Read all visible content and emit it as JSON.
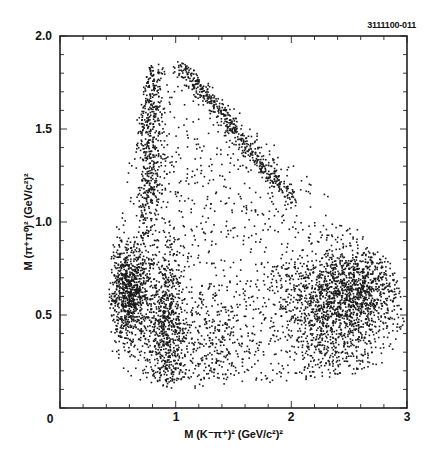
{
  "figure_id": "3111100-011",
  "chart_data": {
    "type": "scatter",
    "title": "",
    "subtitle": "Dalitz plot (dense event scatter)",
    "xlabel": "M (K⁻π⁺)² (GeV/c²)²",
    "ylabel": "M (π⁺π⁰)² (GeV/c²)²",
    "xlim": [
      0,
      3
    ],
    "ylim": [
      0,
      2.0
    ],
    "x_ticks": [
      0,
      1,
      2,
      3
    ],
    "x_tick_labels": [
      "0",
      "1",
      "2",
      "3"
    ],
    "x_minor_step": 0.2,
    "y_ticks": [
      0,
      0.5,
      1.0,
      1.5,
      2.0
    ],
    "y_tick_labels": [
      "0",
      "0.5",
      "1.0",
      "1.5",
      "2.0"
    ],
    "y_minor_step": 0.1,
    "grid": false,
    "legend": null,
    "marker_color": "#1a1a1a",
    "boundary": {
      "description": "Kinematic (Dalitz) boundary enclosing all points",
      "vertices": [
        [
          0.45,
          0.3
        ],
        [
          0.55,
          0.2
        ],
        [
          0.75,
          0.12
        ],
        [
          1.0,
          0.1
        ],
        [
          1.5,
          0.12
        ],
        [
          2.0,
          0.14
        ],
        [
          2.4,
          0.16
        ],
        [
          2.8,
          0.22
        ],
        [
          2.95,
          0.35
        ],
        [
          2.98,
          0.5
        ],
        [
          2.9,
          0.75
        ],
        [
          2.6,
          0.95
        ],
        [
          2.3,
          1.15
        ],
        [
          2.0,
          1.33
        ],
        [
          1.7,
          1.5
        ],
        [
          1.4,
          1.68
        ],
        [
          1.2,
          1.8
        ],
        [
          1.05,
          1.86
        ],
        [
          0.85,
          1.87
        ],
        [
          0.75,
          1.82
        ],
        [
          0.68,
          1.6
        ],
        [
          0.6,
          1.4
        ],
        [
          0.52,
          1.1
        ],
        [
          0.45,
          0.85
        ],
        [
          0.42,
          0.6
        ]
      ]
    },
    "density_regions": [
      {
        "name": "rho-band-left",
        "cx": 0.6,
        "cy": 0.62,
        "sx": 0.09,
        "sy": 0.13,
        "n": 900
      },
      {
        "name": "rho-band-right",
        "cx": 2.55,
        "cy": 0.62,
        "sx": 0.22,
        "sy": 0.12,
        "n": 1100
      },
      {
        "name": "rho-band-mid",
        "cx": 2.2,
        "cy": 0.6,
        "sx": 0.25,
        "sy": 0.14,
        "n": 450
      },
      {
        "name": "kstar-minus-vertical-band",
        "cx": 0.92,
        "cy": 0.45,
        "sx": 0.08,
        "sy": 0.22,
        "n": 650
      },
      {
        "name": "lower-fill",
        "cx": 1.2,
        "cy": 0.35,
        "sx": 0.25,
        "sy": 0.15,
        "n": 380
      },
      {
        "name": "lower-right-fill",
        "cx": 2.35,
        "cy": 0.32,
        "sx": 0.2,
        "sy": 0.12,
        "n": 320
      },
      {
        "name": "left-upper-edge",
        "cx": 0.8,
        "cy": 1.45,
        "sx": 0.06,
        "sy": 0.3,
        "n": 300
      },
      {
        "name": "uniform-background",
        "uniform": true,
        "n": 1500
      }
    ],
    "diagonal_band": {
      "name": "kstar-zero-diagonal-band",
      "from": [
        1.05,
        1.84
      ],
      "to": [
        2.0,
        1.12
      ],
      "width": 0.05,
      "n": 520
    }
  }
}
